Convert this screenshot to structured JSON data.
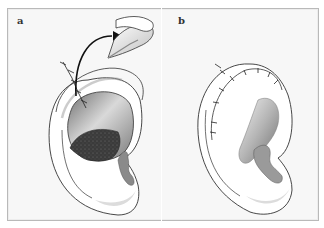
{
  "figure": {
    "panels": [
      {
        "label": "a",
        "description": "Ear with posterior skin flap opened and sutures; arrow from helical rim to harvested rolled cartilage graft"
      },
      {
        "label": "b",
        "description": "Ear after closure with running sutures along the helical rim"
      }
    ]
  },
  "colors": {
    "background": "#f7f7f7",
    "border": "#b9b9b9",
    "outline": "#333333",
    "skin_light": "#ffffff",
    "shadow_gray": "#9a9a9a",
    "cavity_dark": "#3b3b3b"
  }
}
